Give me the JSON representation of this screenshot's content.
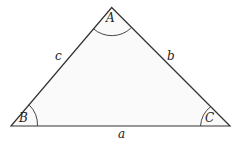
{
  "diagram": {
    "type": "triangle",
    "fill_color": "#fafafa",
    "stroke_color": "#333333",
    "vertices": [
      {
        "name": "A",
        "label": "A",
        "x": 111.7,
        "y": 7.5
      },
      {
        "name": "B",
        "label": "B",
        "x": 11,
        "y": 126
      },
      {
        "name": "C",
        "label": "C",
        "x": 230,
        "y": 126
      }
    ],
    "sides": [
      {
        "name": "a",
        "label": "a",
        "between": [
          "B",
          "C"
        ]
      },
      {
        "name": "b",
        "label": "b",
        "between": [
          "A",
          "C"
        ]
      },
      {
        "name": "c",
        "label": "c",
        "between": [
          "A",
          "B"
        ]
      }
    ]
  }
}
